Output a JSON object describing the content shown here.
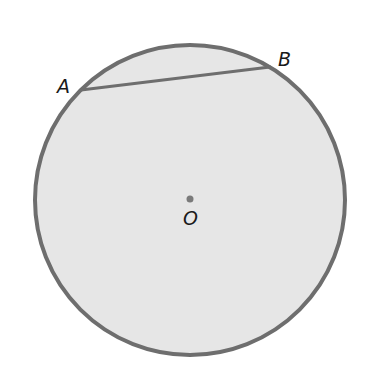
{
  "diagram": {
    "colors": {
      "background": "#ffffff",
      "circle_fill": "#e6e6e6",
      "circle_stroke": "#6e6e6e",
      "chord_stroke": "#6e6e6e",
      "center_dot": "#7a7a7a",
      "label": "#1a1a1a"
    },
    "circle": {
      "cx": 190,
      "cy": 200,
      "r": 155
    },
    "center": {
      "label": "O",
      "x": 190,
      "y": 199
    },
    "points": [
      {
        "label": "A",
        "x": 81,
        "y": 90
      },
      {
        "label": "B",
        "x": 270,
        "y": 67
      }
    ],
    "chord": {
      "from": "A",
      "to": "B"
    },
    "labels": {
      "A": "A",
      "B": "B",
      "O": "O"
    }
  }
}
